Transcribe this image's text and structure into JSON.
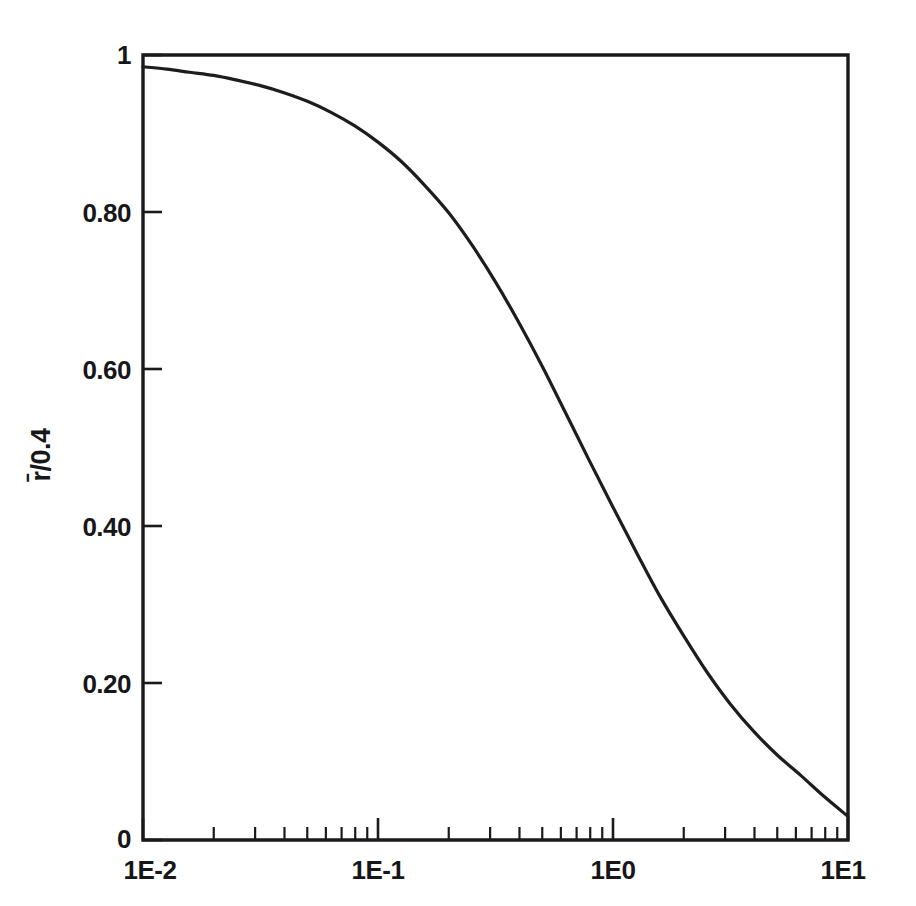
{
  "figure": {
    "background_color": "#ffffff",
    "ink_color": "#17171a"
  },
  "chart_data": {
    "type": "line",
    "title": "",
    "subtitle": "",
    "xlabel": "",
    "ylabel": "r̄/0.4",
    "xscale": "log",
    "yscale": "linear",
    "xlim": [
      0.01,
      10
    ],
    "ylim": [
      0,
      1
    ],
    "grid": false,
    "legend": null,
    "legend_position": "none",
    "x_tick_labels": [
      "1E-2",
      "1E-1",
      "1E0",
      "1E1"
    ],
    "x_tick_values": [
      0.01,
      0.1,
      1,
      10
    ],
    "x_minor_ticks_per_decade": [
      2,
      3,
      4,
      5,
      6,
      7,
      8,
      9
    ],
    "y_tick_labels": [
      "0",
      "0.20",
      "0.40",
      "0.60",
      "0.80",
      "1"
    ],
    "y_tick_values": [
      0,
      0.2,
      0.4,
      0.6,
      0.8,
      1
    ],
    "series": [
      {
        "name": "r̄/0.4",
        "x": [
          0.01,
          0.0126,
          0.0158,
          0.02,
          0.0251,
          0.0316,
          0.0398,
          0.0501,
          0.0631,
          0.0794,
          0.1,
          0.126,
          0.158,
          0.2,
          0.251,
          0.316,
          0.398,
          0.501,
          0.631,
          0.794,
          1.0,
          1.26,
          1.58,
          2.0,
          2.51,
          3.16,
          3.98,
          5.01,
          6.31,
          7.94,
          10.0
        ],
        "values": [
          0.985,
          0.982,
          0.978,
          0.974,
          0.968,
          0.961,
          0.952,
          0.941,
          0.927,
          0.91,
          0.889,
          0.864,
          0.834,
          0.799,
          0.758,
          0.711,
          0.659,
          0.603,
          0.543,
          0.483,
          0.424,
          0.366,
          0.311,
          0.26,
          0.214,
          0.173,
          0.138,
          0.108,
          0.082,
          0.055,
          0.03
        ]
      }
    ],
    "annotations": []
  },
  "axes": {
    "y_label_text": "r̄/0.4",
    "y_label_rotation_deg": -90,
    "x_labels": [
      {
        "text": "1E-2",
        "value": 0.01
      },
      {
        "text": "1E-1",
        "value": 0.1
      },
      {
        "text": "1E0",
        "value": 1
      },
      {
        "text": "1E1",
        "value": 10
      }
    ],
    "y_labels": [
      {
        "text": "1",
        "value": 1
      },
      {
        "text": "0.80",
        "value": 0.8
      },
      {
        "text": "0.60",
        "value": 0.6
      },
      {
        "text": "0.40",
        "value": 0.4
      },
      {
        "text": "0.20",
        "value": 0.2
      },
      {
        "text": "0",
        "value": 0
      }
    ]
  }
}
